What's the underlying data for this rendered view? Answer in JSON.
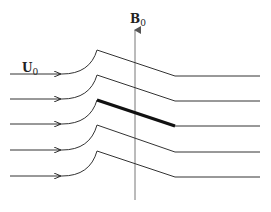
{
  "diagram": {
    "labels": {
      "velocity": "U",
      "velocity_sub": "0",
      "field": "B",
      "field_sub": "0"
    },
    "streamlines": [
      {
        "left_y": 74,
        "peak_y": 50,
        "right_y": 76,
        "thick_segment": false
      },
      {
        "left_y": 99,
        "peak_y": 75,
        "right_y": 101,
        "thick_segment": false
      },
      {
        "left_y": 124,
        "peak_y": 100,
        "right_y": 126,
        "thick_segment": true
      },
      {
        "left_y": 150,
        "peak_y": 125,
        "right_y": 152,
        "thick_segment": false
      },
      {
        "left_y": 176,
        "peak_y": 151,
        "right_y": 177,
        "thick_segment": false
      }
    ],
    "colors": {
      "line": "#333333",
      "thick": "#111111",
      "axis": "#777777"
    }
  }
}
